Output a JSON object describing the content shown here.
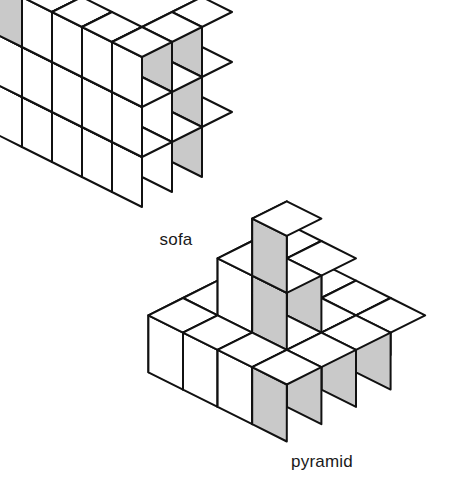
{
  "page": {
    "background_color": "#ffffff",
    "width": 472,
    "height": 483
  },
  "style": {
    "stroke_color": "#111111",
    "face_top_color": "#ffffff",
    "face_left_color": "#ffffff",
    "face_right_light_color": "#ffffff",
    "face_right_shaded_color": "#c9c9c9",
    "stroke_width": 2.0
  },
  "figures": [
    {
      "id": "sofa",
      "label": "sofa",
      "label_x": 176,
      "label_y": 230,
      "origin_x": 22,
      "origin_y": 117,
      "half_width": 30,
      "cube_height": 50,
      "description": "Staircase / sofa shaped stack of unit cubes",
      "grid": {
        "cols": 5,
        "rows": 3
      },
      "heights": [
        [
          1,
          1,
          1,
          1,
          3
        ],
        [
          2,
          2,
          2,
          2,
          3
        ],
        [
          3,
          3,
          3,
          3,
          3
        ]
      ],
      "shaded_right_faces": [
        "0,4,0",
        "0,4,1",
        "0,4,2",
        "1,4,2",
        "2,0,2"
      ],
      "cube_count": 35
    },
    {
      "id": "pyramid",
      "label": "pyramid",
      "label_x": 322,
      "label_y": 452,
      "origin_x": 183,
      "origin_y": 355,
      "half_width": 34.6,
      "cube_height": 57,
      "description": "Stepped pyramid of unit cubes, 4x4 base",
      "grid": {
        "cols": 4,
        "rows": 4
      },
      "heights": [
        [
          1,
          1,
          1,
          1
        ],
        [
          1,
          2,
          2,
          1
        ],
        [
          1,
          2,
          3,
          1
        ],
        [
          1,
          1,
          1,
          1
        ]
      ],
      "shaded_right_faces": [
        "0,3,0",
        "1,3,0",
        "2,3,0",
        "3,3,0",
        "1,2,1",
        "2,2,1",
        "2,2,2"
      ],
      "cube_count": 25
    }
  ]
}
